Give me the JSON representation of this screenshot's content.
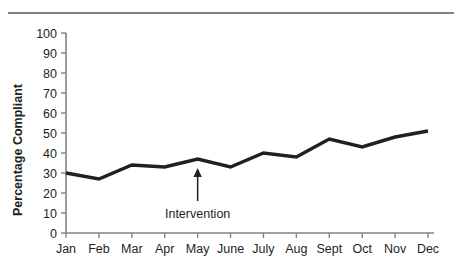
{
  "figure": {
    "has_top_rule": true,
    "background_color": "#ffffff",
    "line_color": "#231f20",
    "axis_color": "#808285"
  },
  "chart_data": {
    "type": "line",
    "title": "",
    "xlabel": "",
    "ylabel": "Percentage Compliant",
    "categories": [
      "Jan",
      "Feb",
      "Mar",
      "Apr",
      "May",
      "June",
      "July",
      "Aug",
      "Sept",
      "Oct",
      "Nov",
      "Dec"
    ],
    "values": [
      30,
      27,
      34,
      33,
      37,
      33,
      40,
      38,
      47,
      43,
      48,
      51
    ],
    "series": [
      {
        "name": "Percentage Compliant",
        "values": [
          30,
          27,
          34,
          33,
          37,
          33,
          40,
          38,
          47,
          43,
          48,
          51
        ]
      }
    ],
    "ylim": [
      0,
      100
    ],
    "ytick_labels": [
      "0",
      "10",
      "20",
      "30",
      "40",
      "50",
      "60",
      "70",
      "80",
      "90",
      "100"
    ],
    "ytick_values": [
      0,
      10,
      20,
      30,
      40,
      50,
      60,
      70,
      80,
      90,
      100
    ],
    "grid": false,
    "legend": null,
    "annotations": [
      {
        "text": "Intervention",
        "target_category": "May",
        "target_value": 37
      }
    ]
  }
}
